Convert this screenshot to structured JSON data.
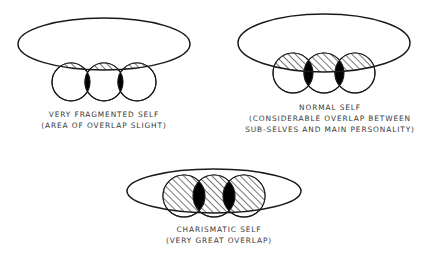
{
  "figure": {
    "background_color": "#ffffff",
    "ink_color": "#1a1a1a",
    "caption_color": "#3a3a3a",
    "hatch_color": "#2b2b2b",
    "lens_fill": "#000000",
    "circle_fill": "#ffffff",
    "ellipse_fill": "#ffffff"
  },
  "diagrams": [
    {
      "id": "very-fragmented-self",
      "caption_lines": [
        "VERY FRAGMENTED SELF",
        "(AREA OF OVERLAP SLIGHT)"
      ],
      "ellipse": {
        "cx": 104,
        "cy": 44,
        "rx": 86,
        "ry": 26
      },
      "circles": [
        {
          "cx": 71,
          "cy": 82,
          "r": 19
        },
        {
          "cx": 104,
          "cy": 82,
          "r": 19
        },
        {
          "cx": 137,
          "cy": 82,
          "r": 19
        }
      ],
      "overlap_description": "slight",
      "caption_x": 104,
      "caption_y": [
        117,
        128
      ]
    },
    {
      "id": "normal-self",
      "caption_lines": [
        "NORMAL SELF",
        "(CONSIDERABLE OVERLAP BETWEEN",
        "SUB-SELVES AND MAIN PERSONALITY)"
      ],
      "ellipse": {
        "cx": 324,
        "cy": 43,
        "rx": 86,
        "ry": 29
      },
      "circles": [
        {
          "cx": 293,
          "cy": 73,
          "r": 20
        },
        {
          "cx": 324,
          "cy": 73,
          "r": 20
        },
        {
          "cx": 355,
          "cy": 73,
          "r": 20
        }
      ],
      "overlap_description": "considerable",
      "caption_x": 330,
      "caption_y": [
        110,
        121,
        132
      ]
    },
    {
      "id": "charismatic-self",
      "caption_lines": [
        "CHARISMATIC SELF",
        "(VERY GREAT OVERLAP)"
      ],
      "ellipse": {
        "cx": 214,
        "cy": 191,
        "rx": 87,
        "ry": 22
      },
      "circles": [
        {
          "cx": 184,
          "cy": 196,
          "r": 21
        },
        {
          "cx": 214,
          "cy": 196,
          "r": 21
        },
        {
          "cx": 244,
          "cy": 196,
          "r": 21
        }
      ],
      "overlap_description": "very great",
      "caption_x": 219,
      "caption_y": [
        232,
        243
      ]
    }
  ]
}
